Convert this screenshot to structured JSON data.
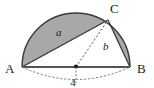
{
  "figure": {
    "type": "geometry-diagram",
    "colors": {
      "shading": "#a8a8a8",
      "outline": "#3a3a3a",
      "baseline": "#555555",
      "dashed": "#555555",
      "label": "#1a1a1a",
      "background": "#ffffff"
    },
    "points": {
      "A": {
        "label": "A",
        "x": 22,
        "y": 67
      },
      "B": {
        "label": "B",
        "x": 130,
        "y": 67
      },
      "C": {
        "label": "C",
        "x": 108,
        "y": 20
      },
      "center": {
        "label": "",
        "x": 76,
        "y": 67
      }
    },
    "segments": [
      {
        "name": "diameter-AB",
        "from": "A",
        "to": "B",
        "style": "solid",
        "label": ""
      },
      {
        "name": "chord-AC",
        "from": "A",
        "to": "C",
        "style": "dashed",
        "label": "a"
      },
      {
        "name": "radius-OC",
        "from": "center",
        "to": "C",
        "style": "dashed",
        "label": "b"
      },
      {
        "name": "chord-CB",
        "from": "C",
        "to": "B",
        "style": "solid",
        "label": ""
      }
    ],
    "labels": {
      "vertex_a": "A",
      "vertex_b": "B",
      "vertex_c": "C",
      "side_a": "a",
      "side_b": "b",
      "measure_bottom": "4"
    },
    "arcs": [
      {
        "name": "semicircle-arc",
        "style": "solid",
        "position": "above-AB"
      },
      {
        "name": "measure-arc",
        "style": "dashed",
        "position": "below-AB",
        "label": "4"
      }
    ]
  }
}
